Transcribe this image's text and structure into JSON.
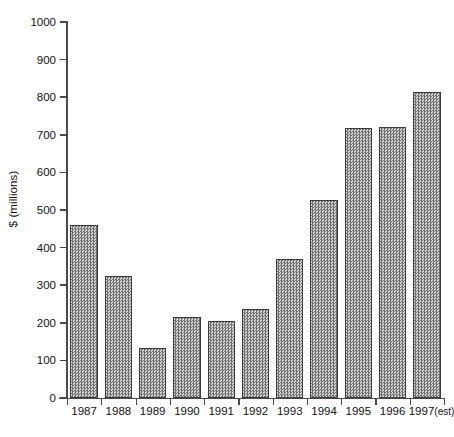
{
  "chart_data": {
    "type": "bar",
    "title": "",
    "xlabel": "",
    "ylabel": "$ (millions)",
    "ylim": [
      0,
      1000
    ],
    "ytick_values": [
      1000,
      900,
      800,
      700,
      600,
      500,
      400,
      300,
      200,
      100,
      0
    ],
    "ytick_labels": [
      "1000",
      "900",
      "800",
      "700",
      "600",
      "500",
      "400",
      "300",
      "200",
      "100",
      "0"
    ],
    "grid": false,
    "legend": null,
    "categories": [
      "1987",
      "1988",
      "1989",
      "1990",
      "1991",
      "1992",
      "1993",
      "1994",
      "1995",
      "1996",
      "1997"
    ],
    "category_labels": [
      "1987",
      "1988",
      "1989",
      "1990",
      "1991",
      "1992",
      "1993",
      "1994",
      "1995",
      "1996",
      "1997(est)"
    ],
    "values": [
      460,
      325,
      133,
      215,
      205,
      237,
      370,
      527,
      718,
      722,
      815
    ],
    "annotations": [
      "1997 value is an estimate"
    ],
    "bar_fill": "#a9a9a9",
    "bar_edge": "#3b3b3b",
    "axis_color": "#4a4a4a"
  },
  "axis": {
    "y_label_text": "$ (millions)"
  }
}
